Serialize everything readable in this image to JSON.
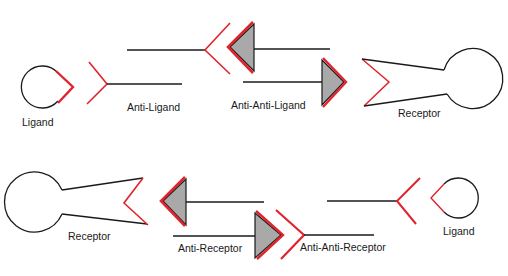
{
  "diagram": {
    "colors": {
      "background": "#ffffff",
      "line": "#1a1a1a",
      "binding_site": "#e0242c",
      "triangle_fill": "#a9a9a9"
    },
    "top_row": {
      "labels": {
        "ligand": "Ligand",
        "anti_ligand": "Anti-Ligand",
        "anti_anti_ligand": "Anti-Anti-Ligand",
        "receptor": "Receptor"
      }
    },
    "bottom_row": {
      "labels": {
        "receptor": "Receptor",
        "anti_receptor": "Anti-Receptor",
        "anti_anti_receptor": "Anti-Anti-Receptor",
        "ligand": "Ligand"
      }
    }
  }
}
